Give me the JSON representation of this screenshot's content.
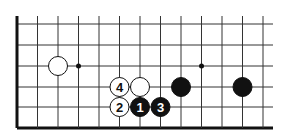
{
  "diagram": {
    "type": "go-board-fragment",
    "grid": {
      "columns_x": [
        17,
        37.5,
        58,
        78.5,
        99,
        119.5,
        140,
        160.5,
        181,
        201.5,
        222,
        242.5,
        263
      ],
      "rows_y": [
        24,
        45,
        66,
        87,
        107,
        128
      ],
      "right_extent_x": 273,
      "left_edge_thick": true,
      "bottom_edge_thick": true
    },
    "star_points": [
      {
        "x": 78.5,
        "y": 66
      },
      {
        "x": 201.5,
        "y": 66
      }
    ],
    "stones": [
      {
        "color": "white",
        "x": 58,
        "y": 66,
        "label": ""
      },
      {
        "color": "white",
        "x": 119.5,
        "y": 87,
        "label": "4"
      },
      {
        "color": "white",
        "x": 140,
        "y": 87,
        "label": ""
      },
      {
        "color": "black",
        "x": 181,
        "y": 87,
        "label": ""
      },
      {
        "color": "black",
        "x": 242.5,
        "y": 87,
        "label": ""
      },
      {
        "color": "white",
        "x": 119.5,
        "y": 107,
        "label": "2"
      },
      {
        "color": "black",
        "x": 140,
        "y": 107,
        "label": "1"
      },
      {
        "color": "black",
        "x": 160.5,
        "y": 107,
        "label": "3"
      }
    ],
    "colors": {
      "line": "#333333",
      "edge": "#111111",
      "black_stone": "#111111",
      "white_stone": "#ffffff"
    }
  }
}
